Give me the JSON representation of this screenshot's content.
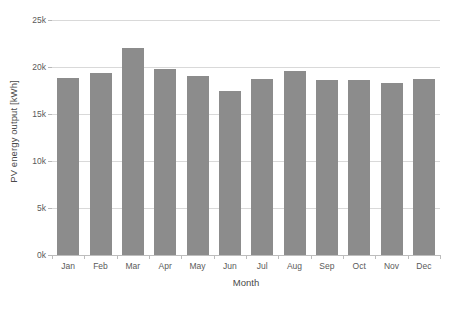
{
  "chart_data": {
    "type": "bar",
    "title": "",
    "subtitle": "",
    "xlabel": "Month",
    "ylabel": "PV energy output [kWh]",
    "categories": [
      "Jan",
      "Feb",
      "Mar",
      "Apr",
      "May",
      "Jun",
      "Jul",
      "Aug",
      "Sep",
      "Oct",
      "Nov",
      "Dec"
    ],
    "values": [
      18800,
      19400,
      22000,
      19800,
      19000,
      17400,
      18700,
      19600,
      18600,
      18600,
      18300,
      18700
    ],
    "series": [
      {
        "name": "PV energy output",
        "values": [
          18800,
          19400,
          22000,
          19800,
          19000,
          17400,
          18700,
          19600,
          18600,
          18600,
          18300,
          18700
        ]
      }
    ],
    "ylim": [
      0,
      25000
    ],
    "xlim": [
      0,
      12
    ],
    "yticks": [
      0,
      5000,
      10000,
      15000,
      20000,
      25000
    ],
    "ytick_labels": [
      "0k",
      "5k",
      "10k",
      "15k",
      "20k",
      "25k"
    ],
    "grid": true,
    "grid_axis": "y",
    "legend": false,
    "legend_position": "none",
    "bar_color": "#8c8c8c",
    "grid_color": "#d9d9d9",
    "axis_color": "#bdbdbd",
    "text_color": "#5a5a5a",
    "background": "#ffffff"
  }
}
